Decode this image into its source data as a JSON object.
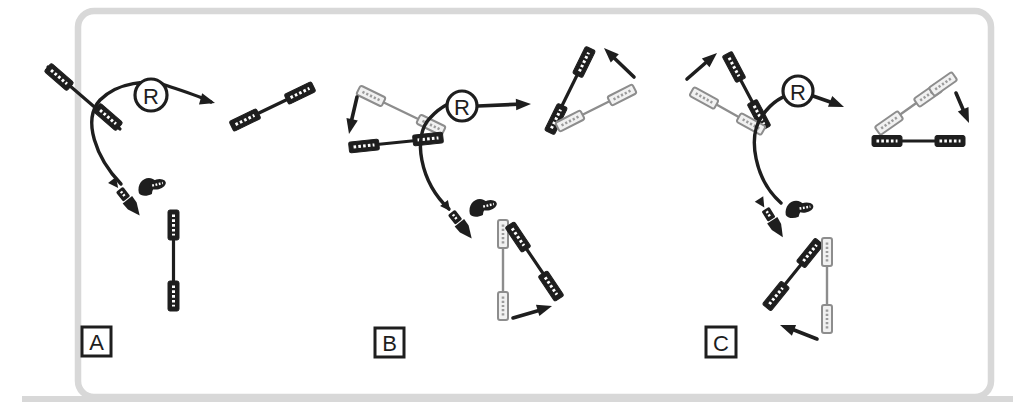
{
  "figure": {
    "type": "reaction-scheme-diagram",
    "panels": [
      {
        "label": "A"
      },
      {
        "label": "B"
      },
      {
        "label": "C"
      }
    ],
    "enzyme": {
      "label": "R"
    },
    "icons": {
      "ribozyme_node": "circled letter R on reaction arrow",
      "substrate_strand_dark": "black line with dark hatched end caps",
      "template_strand_gray": "gray line with light hatched end caps",
      "leaving_group_dart": "small arrow-tipped hatched fragment",
      "released_fragment_blob": "small dark bent blob with striped oval"
    },
    "colors": {
      "ink": "#1e1e1e",
      "gray_strand": "#8d8d8d",
      "gray_cap_fill": "#f1f1f1",
      "frame": "#d8d8d8",
      "background": "#ffffff"
    }
  }
}
